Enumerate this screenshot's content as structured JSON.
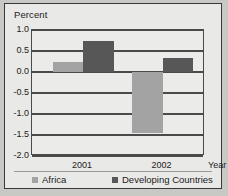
{
  "chart_data": {
    "type": "bar",
    "title": "",
    "ylabel": "Percent",
    "xlabel": "Year",
    "categories": [
      "2001",
      "2002"
    ],
    "series": [
      {
        "name": "Africa",
        "values": [
          0.23,
          -1.45
        ],
        "color": "#a3a3a3"
      },
      {
        "name": "Developing Countries",
        "values": [
          0.75,
          0.33
        ],
        "color": "#575757"
      }
    ],
    "ylim": [
      -2.0,
      1.0
    ],
    "yticks": [
      "1.0",
      "0.5",
      "0.0",
      "-0.5",
      "-1.0",
      "-1.5",
      "-2.0"
    ],
    "ytick_values": [
      1.0,
      0.5,
      0.0,
      -0.5,
      -1.0,
      -1.5,
      -2.0
    ],
    "grid": true,
    "legend_position": "bottom"
  },
  "legend": {
    "entries": [
      {
        "label": "Africa"
      },
      {
        "label": "Developing Countries"
      }
    ]
  }
}
